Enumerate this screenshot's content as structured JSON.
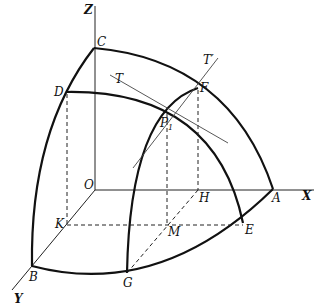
{
  "figure": {
    "type": "3D coordinate diagram of surface patch with tangent lines",
    "axes": {
      "x": "X",
      "y": "Y",
      "z": "Z",
      "origin": "O"
    },
    "points": {
      "A": "A",
      "B": "B",
      "C": "C",
      "D": "D",
      "E": "E",
      "F": "F",
      "G": "G",
      "H": "H",
      "K": "K",
      "M": "M",
      "P1": "P",
      "P1_sub": "1"
    },
    "tangents": {
      "T": "T",
      "T_prime": "T′"
    }
  }
}
